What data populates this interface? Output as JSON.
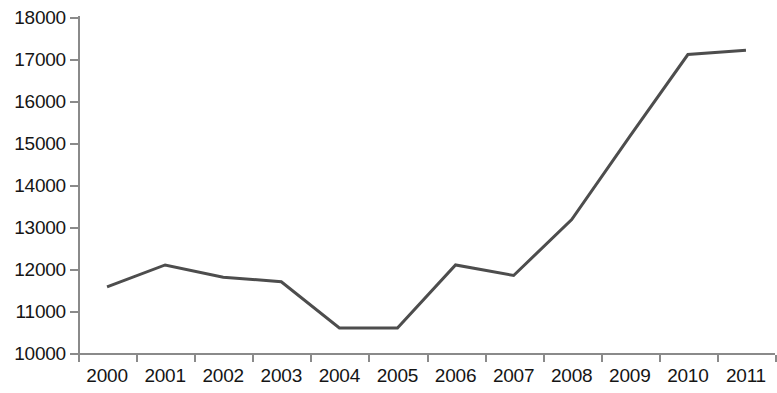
{
  "chart_data": {
    "type": "line",
    "title": "",
    "subtitle": "",
    "xlabel": "",
    "ylabel": "",
    "categories": [
      "2000",
      "2001",
      "2002",
      "2003",
      "2004",
      "2005",
      "2006",
      "2007",
      "2008",
      "2009",
      "2010",
      "2011"
    ],
    "series": [
      {
        "name": "",
        "values": [
          11600,
          12120,
          11830,
          11720,
          10620,
          10620,
          12120,
          11870,
          13200,
          15180,
          17130,
          17230
        ]
      }
    ],
    "ylim": [
      10000,
      18000
    ],
    "y_ticks": [
      10000,
      11000,
      12000,
      13000,
      14000,
      15000,
      16000,
      17000,
      18000
    ],
    "y_tick_labels": [
      "10000",
      "11000",
      "12000",
      "13000",
      "14000",
      "15000",
      "16000",
      "17000",
      "18000"
    ],
    "grid": false,
    "legend": "none",
    "line_color": "#4d4d4d",
    "axis_color": "#8a8a8a",
    "background_color": "#ffffff"
  }
}
